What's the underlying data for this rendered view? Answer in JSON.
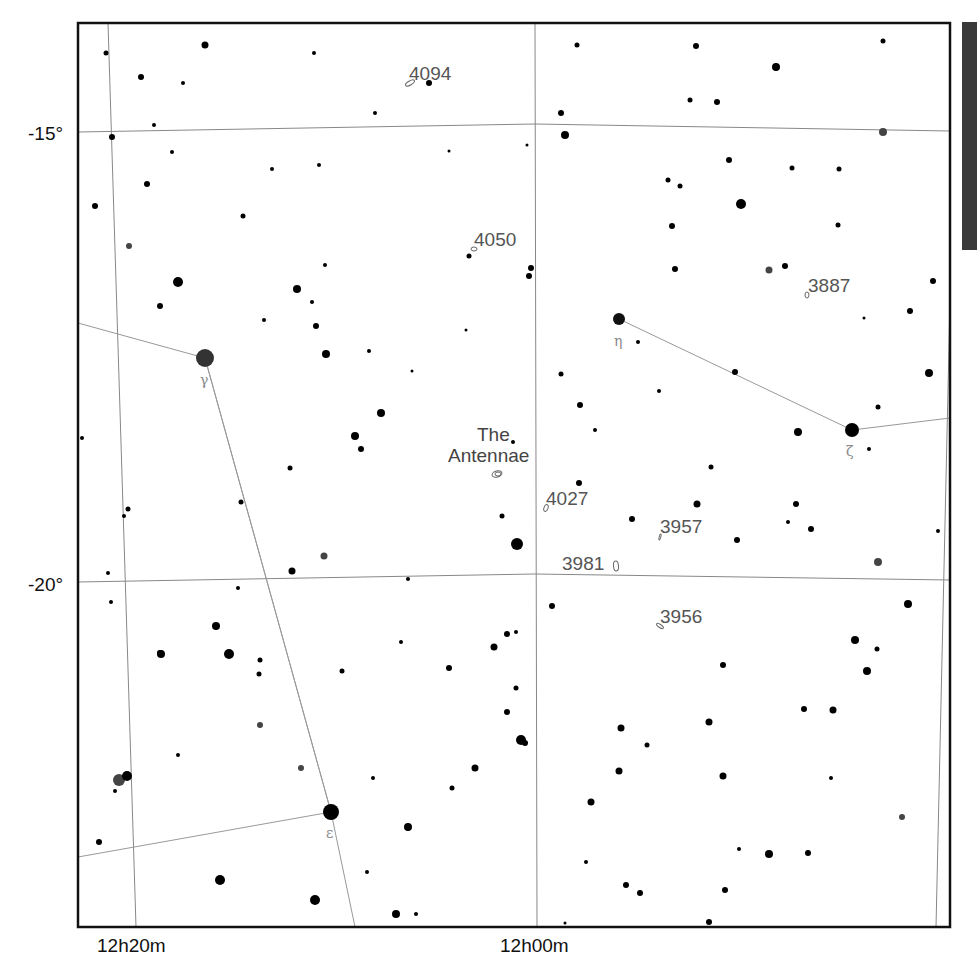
{
  "map": {
    "title": "Star chart — Corvus / Crater region around The Antennae",
    "frame": {
      "left": 78,
      "top": 23,
      "right": 950,
      "bottom": 927
    },
    "dec_labels": [
      {
        "text": "-15°",
        "x": 28,
        "y": 140
      },
      {
        "text": "-20°",
        "x": 28,
        "y": 591
      }
    ],
    "ra_labels": [
      {
        "text": "12h20m",
        "x": 97,
        "y": 952
      },
      {
        "text": "12h00m",
        "x": 500,
        "y": 952
      }
    ],
    "grid_dec_lines": [
      {
        "label": "-15°",
        "points": [
          [
            78,
            132
          ],
          [
            535,
            124
          ],
          [
            950,
            131
          ]
        ]
      },
      {
        "label": "-20°",
        "points": [
          [
            78,
            582
          ],
          [
            535,
            574
          ],
          [
            950,
            580
          ]
        ]
      }
    ],
    "grid_ra_lines": [
      {
        "label": "12h20m",
        "points": [
          [
            108,
            23
          ],
          [
            136,
            927
          ]
        ]
      },
      {
        "label": "12h00m",
        "points": [
          [
            535,
            23
          ],
          [
            537,
            927
          ]
        ]
      },
      {
        "label": "11h40m",
        "points": [
          [
            950,
            300
          ],
          [
            936,
            927
          ]
        ]
      }
    ],
    "constellation_lines": [
      [
        [
          78,
          323
        ],
        [
          205,
          358
        ],
        [
          331,
          812
        ],
        [
          78,
          857
        ]
      ],
      [
        [
          205,
          358
        ],
        [
          331,
          812
        ],
        [
          355,
          927
        ]
      ],
      [
        [
          619,
          319
        ],
        [
          852,
          430
        ],
        [
          950,
          418
        ]
      ]
    ],
    "bayer_stars": [
      {
        "name": "gamma",
        "glyph": "γ",
        "x": 205,
        "y": 358,
        "r": 9,
        "color": "#333333",
        "label_x": 200,
        "label_y": 385
      },
      {
        "name": "epsilon",
        "glyph": "ε",
        "x": 331,
        "y": 812,
        "r": 8,
        "color": "#000000",
        "label_x": 326,
        "label_y": 838
      },
      {
        "name": "eta",
        "glyph": "η",
        "x": 619,
        "y": 319,
        "r": 6,
        "color": "#111111",
        "label_x": 614,
        "label_y": 346
      },
      {
        "name": "zeta",
        "glyph": "ζ",
        "x": 852,
        "y": 430,
        "r": 7,
        "color": "#000000",
        "label_x": 846,
        "label_y": 456
      }
    ],
    "deep_sky_objects": [
      {
        "name": "4094",
        "label_x": 409,
        "label_y": 74,
        "sym_x": 410,
        "sym_y": 83,
        "rx": 5,
        "ry": 2,
        "rot": -30
      },
      {
        "name": "4050",
        "label_x": 474,
        "label_y": 240,
        "sym_x": 474,
        "sym_y": 249,
        "rx": 3,
        "ry": 2,
        "rot": 0
      },
      {
        "name": "3887",
        "label_x": 808,
        "label_y": 286,
        "sym_x": 807,
        "sym_y": 295,
        "rx": 2,
        "ry": 3,
        "rot": 0
      },
      {
        "name": "4027",
        "label_x": 546,
        "label_y": 499,
        "sym_x": 546,
        "sym_y": 508,
        "rx": 2,
        "ry": 3.5,
        "rot": 20
      },
      {
        "name": "3957",
        "label_x": 660,
        "label_y": 527,
        "sym_x": 660,
        "sym_y": 537,
        "rx": 0.8,
        "ry": 3,
        "rot": 15
      },
      {
        "name": "3981",
        "label_x": 562,
        "label_y": 564,
        "sym_x": 616,
        "sym_y": 566,
        "rx": 2.5,
        "ry": 5,
        "rot": -5
      },
      {
        "name": "3956",
        "label_x": 660,
        "label_y": 617,
        "sym_x": 660,
        "sym_y": 626,
        "rx": 4,
        "ry": 1.5,
        "rot": 35
      }
    ],
    "antennae": {
      "line1": "The",
      "line2": "Antennae",
      "line1_x": 477,
      "line1_y": 441,
      "line2_x": 448,
      "line2_y": 462,
      "sym_x": 497,
      "sym_y": 474
    },
    "stars": [
      [
        106,
        53,
        2.5
      ],
      [
        141,
        77,
        3
      ],
      [
        205,
        45,
        3.5
      ],
      [
        183,
        83,
        2
      ],
      [
        314,
        53,
        2
      ],
      [
        429,
        83,
        3
      ],
      [
        375,
        113,
        2
      ],
      [
        577,
        45,
        2.5
      ],
      [
        696,
        46,
        3
      ],
      [
        561,
        113,
        3
      ],
      [
        776,
        67,
        4
      ],
      [
        883,
        41,
        2.5
      ],
      [
        112,
        137,
        3
      ],
      [
        154,
        125,
        2
      ],
      [
        172,
        152,
        2
      ],
      [
        147,
        184,
        3
      ],
      [
        95,
        206,
        3
      ],
      [
        243,
        216,
        2.5
      ],
      [
        272,
        169,
        2
      ],
      [
        319,
        165,
        2
      ],
      [
        449,
        151,
        1.5
      ],
      [
        527,
        145,
        1.5
      ],
      [
        565,
        135,
        4
      ],
      [
        690,
        100,
        2.5
      ],
      [
        717,
        102,
        3
      ],
      [
        741,
        204,
        5
      ],
      [
        729,
        160,
        3
      ],
      [
        668,
        180,
        2.5
      ],
      [
        680,
        186,
        2.5
      ],
      [
        672,
        226,
        3
      ],
      [
        792,
        168,
        2.5
      ],
      [
        839,
        169,
        2.5
      ],
      [
        838,
        225,
        2.5
      ],
      [
        883,
        132,
        4
      ],
      [
        933,
        281,
        3
      ],
      [
        910,
        311,
        3
      ],
      [
        929,
        373,
        4
      ],
      [
        864,
        318,
        1.5
      ],
      [
        675,
        269,
        3
      ],
      [
        769,
        270,
        3.5
      ],
      [
        785,
        266,
        3
      ],
      [
        129,
        246,
        3
      ],
      [
        178,
        282,
        5
      ],
      [
        160,
        306,
        3
      ],
      [
        297,
        289,
        4
      ],
      [
        312,
        302,
        2
      ],
      [
        316,
        326,
        3
      ],
      [
        264,
        320,
        2
      ],
      [
        325,
        265,
        2
      ],
      [
        531,
        268,
        3
      ],
      [
        529,
        276,
        3
      ],
      [
        469,
        256,
        2.5
      ],
      [
        466,
        330,
        1.5
      ],
      [
        369,
        351,
        2
      ],
      [
        326,
        354,
        4
      ],
      [
        412,
        371,
        1.5
      ],
      [
        561,
        374,
        2.5
      ],
      [
        580,
        405,
        3
      ],
      [
        595,
        430,
        2
      ],
      [
        638,
        342,
        2
      ],
      [
        659,
        391,
        2
      ],
      [
        735,
        372,
        3
      ],
      [
        878,
        407,
        2.5
      ],
      [
        798,
        432,
        4
      ],
      [
        869,
        449,
        2
      ],
      [
        381,
        413,
        4
      ],
      [
        355,
        436,
        4
      ],
      [
        361,
        449,
        3
      ],
      [
        290,
        468,
        2.5
      ],
      [
        241,
        502,
        2.5
      ],
      [
        513,
        442,
        2
      ],
      [
        502,
        516,
        2.5
      ],
      [
        517,
        544,
        6
      ],
      [
        579,
        483,
        3
      ],
      [
        711,
        467,
        2.5
      ],
      [
        697,
        504,
        3.5
      ],
      [
        796,
        504,
        3
      ],
      [
        788,
        522,
        2
      ],
      [
        811,
        529,
        3
      ],
      [
        737,
        540,
        3
      ],
      [
        938,
        531,
        2
      ],
      [
        878,
        562,
        4
      ],
      [
        908,
        604,
        4
      ],
      [
        82,
        438,
        2
      ],
      [
        128,
        509,
        2.5
      ],
      [
        124,
        516,
        2
      ],
      [
        108,
        573,
        2
      ],
      [
        111,
        602,
        2
      ],
      [
        238,
        588,
        2
      ],
      [
        292,
        571,
        3.5
      ],
      [
        324,
        556,
        3.5
      ],
      [
        408,
        579,
        2
      ],
      [
        552,
        606,
        3
      ],
      [
        161,
        654,
        4
      ],
      [
        160,
        653,
        3
      ],
      [
        229,
        654,
        5
      ],
      [
        216,
        626,
        4
      ],
      [
        260,
        660,
        2.5
      ],
      [
        259,
        674,
        2.5
      ],
      [
        260,
        725,
        3
      ],
      [
        178,
        755,
        2
      ],
      [
        301,
        768,
        3
      ],
      [
        119,
        780,
        6
      ],
      [
        127,
        776,
        5
      ],
      [
        115,
        791,
        2
      ],
      [
        99,
        842,
        3
      ],
      [
        220,
        880,
        5
      ],
      [
        315,
        900,
        5
      ],
      [
        367,
        872,
        2
      ],
      [
        342,
        671,
        2.5
      ],
      [
        449,
        668,
        3
      ],
      [
        408,
        827,
        4
      ],
      [
        373,
        778,
        2
      ],
      [
        401,
        642,
        2
      ],
      [
        494,
        647,
        3.5
      ],
      [
        507,
        634,
        3
      ],
      [
        516,
        632,
        2
      ],
      [
        516,
        688,
        2.5
      ],
      [
        507,
        712,
        3
      ],
      [
        521,
        740,
        5
      ],
      [
        525,
        743,
        3
      ],
      [
        475,
        768,
        3.5
      ],
      [
        452,
        788,
        2.5
      ],
      [
        416,
        914,
        2
      ],
      [
        396,
        914,
        4
      ],
      [
        565,
        923,
        1.5
      ],
      [
        621,
        728,
        3.5
      ],
      [
        619,
        771,
        3.5
      ],
      [
        591,
        802,
        3.5
      ],
      [
        586,
        862,
        2
      ],
      [
        626,
        885,
        3
      ],
      [
        640,
        893,
        3
      ],
      [
        709,
        922,
        3
      ],
      [
        647,
        745,
        2.5
      ],
      [
        723,
        665,
        3
      ],
      [
        709,
        722,
        3.5
      ],
      [
        723,
        776,
        3.5
      ],
      [
        804,
        709,
        3
      ],
      [
        833,
        710,
        3.5
      ],
      [
        831,
        778,
        2
      ],
      [
        855,
        640,
        4
      ],
      [
        867,
        671,
        4
      ],
      [
        877,
        649,
        2.5
      ],
      [
        902,
        817,
        3
      ],
      [
        739,
        849,
        2
      ],
      [
        769,
        854,
        4
      ],
      [
        808,
        853,
        3
      ],
      [
        725,
        890,
        3
      ],
      [
        632,
        519,
        3
      ]
    ],
    "grey_stars": [
      [
        129,
        246
      ],
      [
        883,
        132
      ],
      [
        769,
        270
      ],
      [
        878,
        562
      ],
      [
        324,
        556
      ],
      [
        119,
        780
      ],
      [
        260,
        725
      ],
      [
        902,
        817
      ],
      [
        301,
        768
      ],
      [
        367,
        812
      ]
    ]
  }
}
